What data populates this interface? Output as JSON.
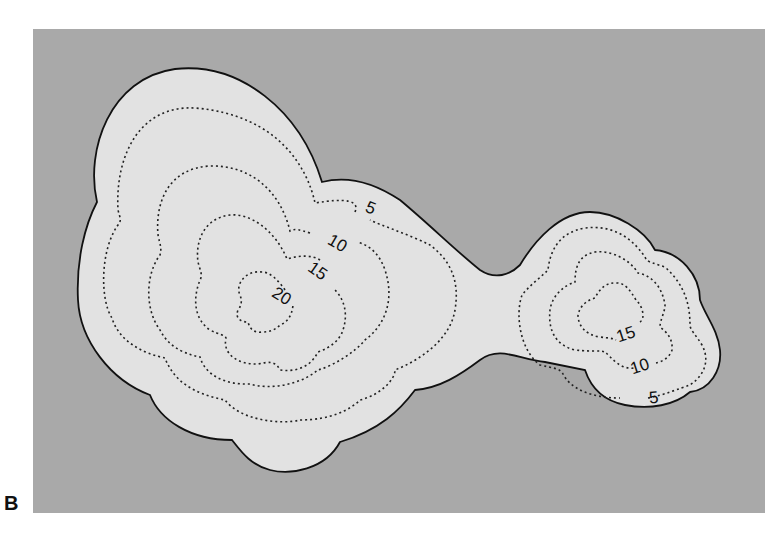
{
  "figure": {
    "panel_label": "B",
    "background_color": "#a9a9a9",
    "land_fill": "#e2e2e2",
    "outline_color": "#111111",
    "contour_color": "#222222",
    "contour_labels": {
      "left_peak": {
        "c5": "5",
        "c10": "10",
        "c15": "15",
        "c20": "20"
      },
      "right_peak": {
        "c5": "5",
        "c10": "10",
        "c15": "15"
      }
    }
  }
}
